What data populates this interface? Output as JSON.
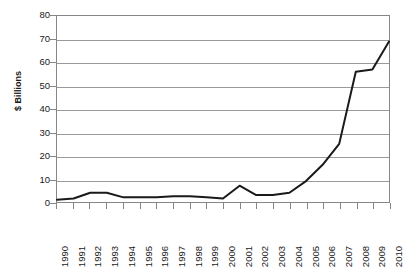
{
  "chart_data": {
    "type": "line",
    "title": "",
    "subtitle": "",
    "xlabel": "",
    "ylabel": "$ Billions",
    "x": [
      1990,
      1991,
      1992,
      1993,
      1994,
      1995,
      1996,
      1997,
      1998,
      1999,
      2000,
      2001,
      2002,
      2003,
      2004,
      2005,
      2006,
      2007,
      2008,
      2009,
      2010
    ],
    "categories": [
      "1990",
      "1991",
      "1992",
      "1993",
      "1994",
      "1995",
      "1996",
      "1997",
      "1998",
      "1999",
      "2000",
      "2001",
      "2002",
      "2003",
      "2004",
      "2005",
      "2006",
      "2007",
      "2008",
      "2009",
      "2010"
    ],
    "values": [
      1,
      1.5,
      4,
      4,
      2,
      2,
      2,
      2.5,
      2.5,
      2,
      1.5,
      7,
      3,
      3,
      4,
      9,
      16,
      25,
      56,
      57,
      69
    ],
    "series": [
      {
        "name": "$ Billions",
        "values": [
          1,
          1.5,
          4,
          4,
          2,
          2,
          2,
          2.5,
          2.5,
          2,
          1.5,
          7,
          3,
          3,
          4,
          9,
          16,
          25,
          56,
          57,
          69
        ],
        "color": "#1a1a1a"
      }
    ],
    "ylim": [
      0,
      80
    ],
    "ytick_step": 10,
    "yticks": [
      0,
      10,
      20,
      30,
      40,
      50,
      60,
      70,
      80
    ],
    "ytick_labels": [
      "0",
      "10",
      "20",
      "30",
      "40",
      "50",
      "60",
      "70",
      "80"
    ],
    "grid": true,
    "grid_axis": "y",
    "legend": false,
    "legend_position": "none",
    "line_color": "#1a1a1a",
    "line_width": 2,
    "markers": false,
    "plot_background": "#ffffff",
    "border_color": "#868686",
    "gridline_color": "#9a9a9a",
    "xtick_rotation": -90
  }
}
